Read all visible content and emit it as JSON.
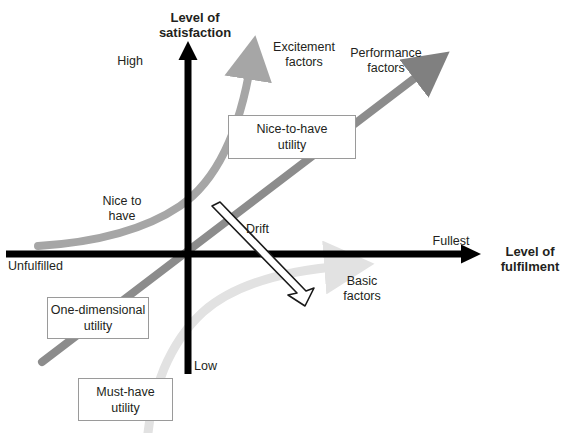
{
  "diagram": {
    "type": "kano-model",
    "title_implicit": "Kano model of customer satisfaction",
    "background_color": "#ffffff"
  },
  "axes": {
    "vertical": {
      "title": "Level of\nsatisfaction",
      "high_label": "High",
      "low_label": "Low",
      "color": "#000000"
    },
    "horizontal": {
      "title": "Level of\nfulfilment",
      "left_label": "Unfulfilled",
      "right_label": "Fullest",
      "color": "#000000"
    }
  },
  "curves": [
    {
      "name": "excitement",
      "label": "Excitement\nfactors",
      "inner_label": "Nice to\nhave",
      "color": "#a6a6a6",
      "shape": "exponential"
    },
    {
      "name": "performance",
      "label": "Performance\nfactors",
      "color": "#808080",
      "shape": "linear"
    },
    {
      "name": "basic",
      "label": "Basic\nfactors",
      "color": "#e2e2e2",
      "shape": "logarithmic"
    }
  ],
  "drift": {
    "label": "Drift",
    "color": "#000000",
    "style": "hollow-outline-arrow"
  },
  "callouts": [
    {
      "name": "nice-to-have",
      "text": "Nice-to-have\nutility"
    },
    {
      "name": "one-dimensional",
      "text": "One-dimensional\nutility"
    },
    {
      "name": "must-have",
      "text": "Must-have\nutility"
    }
  ],
  "colors": {
    "axis": "#000000",
    "excitement": "#a6a6a6",
    "performance": "#808080",
    "basic": "#e2e2e2",
    "box_border": "#9a9a9a",
    "text": "#231f20"
  }
}
